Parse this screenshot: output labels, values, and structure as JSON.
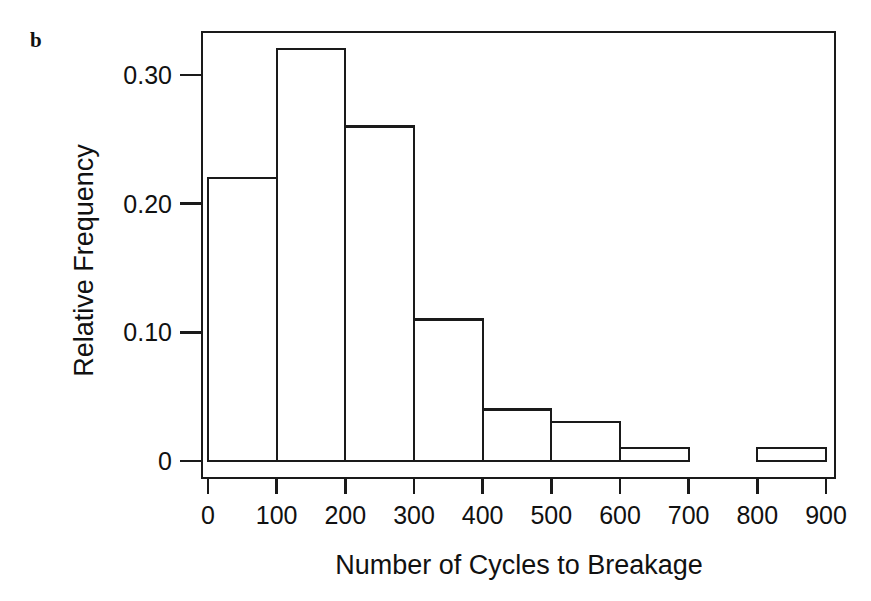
{
  "figure": {
    "panel_label": "b",
    "background_color": "#ffffff",
    "line_color": "#1a1a1a"
  },
  "chart_data": {
    "type": "bar",
    "title": "",
    "subtitle": "",
    "xlabel": "Number of Cycles to Breakage",
    "ylabel": "Relative Frequency",
    "categories": [
      "0-100",
      "100-200",
      "200-300",
      "300-400",
      "400-500",
      "500-600",
      "600-700",
      "700-800",
      "800-900"
    ],
    "bin_edges": [
      0,
      100,
      200,
      300,
      400,
      500,
      600,
      700,
      800,
      900
    ],
    "values": [
      0.22,
      0.32,
      0.26,
      0.11,
      0.04,
      0.03,
      0.01,
      0.0,
      0.01
    ],
    "xlim": [
      0,
      900
    ],
    "ylim": [
      0,
      0.345
    ],
    "xticks": [
      0,
      100,
      200,
      300,
      400,
      500,
      600,
      700,
      800,
      900
    ],
    "xtick_labels": [
      "0",
      "100",
      "200",
      "300",
      "400",
      "500",
      "600",
      "700",
      "800",
      "900"
    ],
    "yticks": [
      0,
      0.1,
      0.2,
      0.3
    ],
    "ytick_labels": [
      "0",
      "0.10",
      "0.20",
      "0.30"
    ],
    "grid": false,
    "legend": "none",
    "bar_fill": "#ffffff",
    "bar_edge": "#1a1a1a",
    "frame": "box"
  }
}
